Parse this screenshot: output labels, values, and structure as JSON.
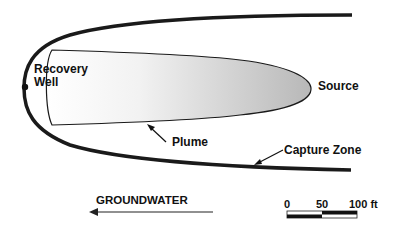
{
  "diagram": {
    "type": "groundwater-plume-capture",
    "labels": {
      "recovery_well_line1": "Recovery",
      "recovery_well_line2": "Well",
      "source": "Source",
      "plume": "Plume",
      "capture_zone": "Capture Zone",
      "groundwater": "GROUNDWATER"
    },
    "scale_bar": {
      "ticks": [
        "0",
        "50",
        "100 ft"
      ]
    },
    "colors": {
      "outline": "#1a1a1a",
      "plume_light": "#ffffff",
      "plume_dark": "#bdbdbd",
      "background": "#ffffff"
    }
  }
}
